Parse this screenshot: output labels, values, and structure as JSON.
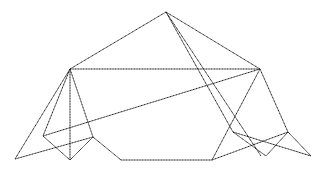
{
  "diagram": {
    "type": "wireframe-polyhedron",
    "stroke_color": "#1a1a1a",
    "background": "#ffffff",
    "vertices": {
      "A": [
        166,
        12
      ],
      "B": [
        70,
        69
      ],
      "C": [
        260,
        69
      ],
      "D": [
        15,
        159
      ],
      "E": [
        43,
        136
      ],
      "F": [
        70,
        160
      ],
      "G": [
        93,
        137
      ],
      "H": [
        121,
        160
      ],
      "I": [
        212,
        160
      ],
      "J": [
        233,
        132
      ],
      "K": [
        288,
        132
      ],
      "L": [
        261,
        156
      ],
      "M": [
        266,
        156
      ],
      "N": [
        311,
        156
      ]
    },
    "edges": [
      [
        "A",
        "B"
      ],
      [
        "A",
        "C"
      ],
      [
        "A",
        "J"
      ],
      [
        "A",
        "L"
      ],
      [
        "B",
        "C"
      ],
      [
        "B",
        "D"
      ],
      [
        "B",
        "E"
      ],
      [
        "B",
        "F"
      ],
      [
        "B",
        "G"
      ],
      [
        "E",
        "F"
      ],
      [
        "F",
        "G"
      ],
      [
        "D",
        "G"
      ],
      [
        "E",
        "C"
      ],
      [
        "G",
        "H"
      ],
      [
        "H",
        "I"
      ],
      [
        "C",
        "I"
      ],
      [
        "C",
        "K"
      ],
      [
        "I",
        "K"
      ],
      [
        "J",
        "M"
      ],
      [
        "J",
        "N"
      ],
      [
        "K",
        "M"
      ],
      [
        "K",
        "N"
      ]
    ]
  }
}
